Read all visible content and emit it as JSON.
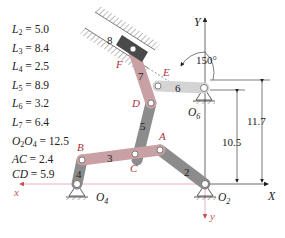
{
  "parameters": [
    {
      "sym": "L",
      "sub": "2",
      "value": "5.0"
    },
    {
      "sym": "L",
      "sub": "3",
      "value": "8.4"
    },
    {
      "sym": "L",
      "sub": "4",
      "value": "2.5"
    },
    {
      "sym": "L",
      "sub": "5",
      "value": "8.9"
    },
    {
      "sym": "L",
      "sub": "6",
      "value": "3.2"
    },
    {
      "sym": "L",
      "sub": "7",
      "value": "6.4"
    },
    {
      "sym": "O",
      "sub": "2",
      "sym2": "O",
      "sub2": "4",
      "value": "12.5"
    },
    {
      "sym": "AC",
      "sub": "",
      "value": "2.4"
    },
    {
      "sym": "CD",
      "sub": "",
      "value": "5.9"
    }
  ],
  "labels": {
    "link2": "2",
    "link3": "3",
    "link4": "4",
    "link5": "5",
    "link6": "6",
    "link7": "7",
    "link8": "8",
    "pointA": "A",
    "pointB": "B",
    "pointC": "C",
    "pointD": "D",
    "pointE": "E",
    "pointF": "F",
    "O2": "O",
    "O2sub": "2",
    "O4": "O",
    "O4sub": "4",
    "O6": "O",
    "O6sub": "6",
    "axisX": "X",
    "axisY": "Y",
    "axis_x_local": "x",
    "axis_y_local": "y",
    "angle": "150°",
    "dim1": "10.5",
    "dim2": "11.7"
  },
  "colors": {
    "link_grey": "#8c8c8c",
    "link_pink": "#c9a0a4",
    "slider": "#4a4a4a",
    "label_red": "#b03040",
    "axis_red": "#c8505a",
    "ink": "#222222"
  }
}
